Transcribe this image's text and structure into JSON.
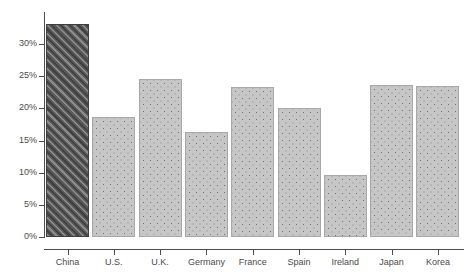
{
  "chart_data": {
    "type": "bar",
    "title": "",
    "subtitle": "",
    "xlabel": "",
    "ylabel": "",
    "categories": [
      "China",
      "U.S.",
      "U.K.",
      "Germany",
      "France",
      "Spain",
      "Ireland",
      "Japan",
      "Korea"
    ],
    "values": [
      33.1,
      18.7,
      24.6,
      16.3,
      23.3,
      20.1,
      9.6,
      23.6,
      23.4
    ],
    "value_labels": [
      "33.1%",
      "18.7%",
      "24.6%",
      "16.3%",
      "23.3%",
      "20.1%",
      "9.6%",
      "23.6%",
      "23.4%"
    ],
    "ylim": [
      0,
      35
    ],
    "ytick_values": [
      0,
      5,
      10,
      15,
      20,
      25,
      30
    ],
    "ytick_labels": [
      "0%",
      "5%",
      "10%",
      "15%",
      "20%",
      "25%",
      "30%"
    ],
    "grid": false,
    "legend": false,
    "legend_position": "none",
    "highlight_category": "China",
    "series": [
      {
        "name": "share",
        "values": [
          33.1,
          18.7,
          24.6,
          16.3,
          23.3,
          20.1,
          9.6,
          23.6,
          23.4
        ]
      }
    ],
    "styles": {
      "highlight_fill": "#595959",
      "highlight_pattern": "diagonal-hatch",
      "bar_fill": "#c6c6c6",
      "bar_pattern": "dotted",
      "bar_edge": "#a8a8a8",
      "axis_color": "#4d4d4d",
      "tick_label_color": "#4a4a4a",
      "background": "#ffffff"
    }
  }
}
